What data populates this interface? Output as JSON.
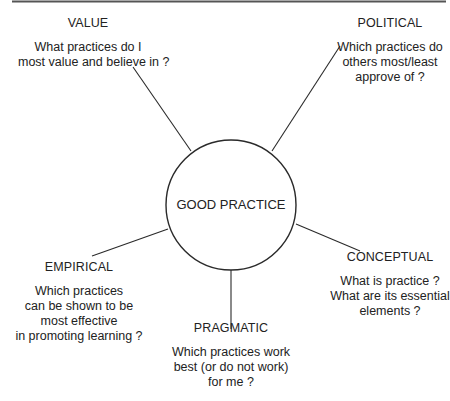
{
  "diagram": {
    "center": {
      "label": "GOOD PRACTICE"
    },
    "nodes": [
      {
        "id": "value",
        "heading": "VALUE",
        "question_lines": [
          "What practices do I",
          "most value and believe in ?"
        ]
      },
      {
        "id": "political",
        "heading": "POLITICAL",
        "question_lines": [
          "Which practices do",
          "others most/least",
          "approve of ?"
        ]
      },
      {
        "id": "conceptual",
        "heading": "CONCEPTUAL",
        "question_lines": [
          "What is practice ?",
          "What are its essential",
          "elements ?"
        ]
      },
      {
        "id": "pragmatic",
        "heading": "PRAGMATIC",
        "question_lines": [
          "Which practices work",
          "best (or do not work)",
          "for  me ?"
        ]
      },
      {
        "id": "empirical",
        "heading": "EMPIRICAL",
        "question_lines": [
          "Which practices",
          "can be shown to be",
          "most effective",
          "in promoting learning ?"
        ]
      }
    ],
    "colors": {
      "stroke": "#2a2a2a",
      "text": "#222222",
      "border": "#555555"
    }
  }
}
